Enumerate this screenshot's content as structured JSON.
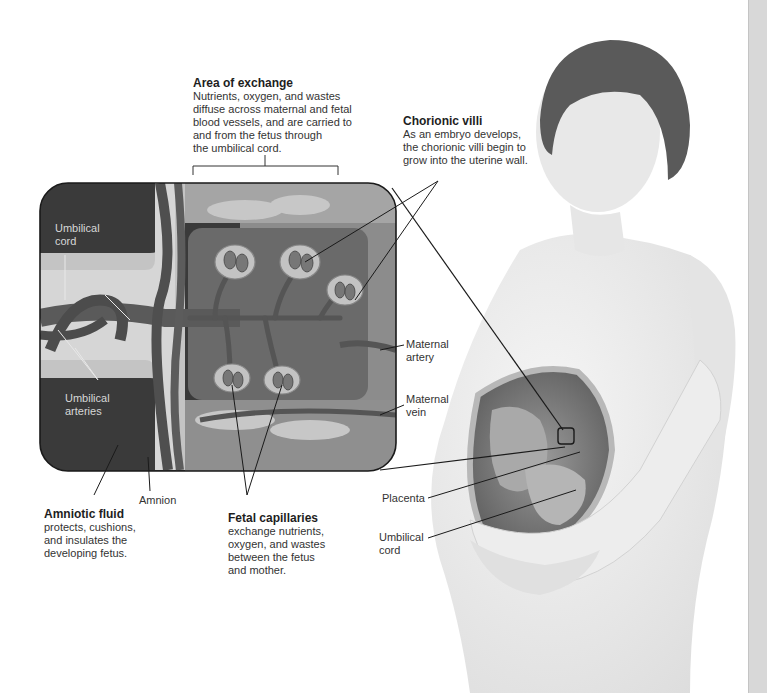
{
  "figure": {
    "callouts": {
      "area_of_exchange": {
        "title": "Area of exchange",
        "lines": [
          "Nutrients, oxygen, and wastes",
          "diffuse across maternal and fetal",
          "blood vessels, and are carried to",
          "and from the fetus through",
          "the umbilical cord."
        ]
      },
      "chorionic_villi": {
        "title": "Chorionic villi",
        "lines": [
          "As an embryo develops,",
          "the chorionic villi begin to",
          "grow into the uterine wall."
        ]
      },
      "amniotic_fluid": {
        "title": "Amniotic fluid",
        "lines": [
          "protects, cushions,",
          "and insulates the",
          "developing fetus."
        ]
      },
      "fetal_capillaries": {
        "title": "Fetal capillaries",
        "lines": [
          "exchange nutrients,",
          "oxygen, and wastes",
          "between the fetus",
          "and mother."
        ]
      }
    },
    "inset_labels": {
      "umbilical_cord": [
        "Umbilical",
        "cord"
      ],
      "umbilical_vein": [
        "Umbilical",
        "vein"
      ],
      "umbilical_arteries": [
        "Umbilical",
        "arteries"
      ]
    },
    "outer_labels": {
      "maternal_artery": [
        "Maternal",
        "artery"
      ],
      "maternal_vein": [
        "Maternal",
        "vein"
      ],
      "amnion": "Amnion",
      "placenta": "Placenta",
      "umbilical_cord": [
        "Umbilical",
        "cord"
      ]
    },
    "colors": {
      "inset_dark": "#3a3a3a",
      "inset_mid": "#6f6f6f",
      "inset_light": "#b8b8b8",
      "vessel": "#5a5a5a",
      "leader_line": "#222222",
      "figure_skin": "#eaeaea",
      "side_strip": "#d8d8d8"
    }
  }
}
